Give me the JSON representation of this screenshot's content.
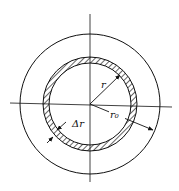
{
  "diagram": {
    "title": "",
    "labels": {
      "inner_radius": "r",
      "outer_radius": "r₀",
      "thickness": "Δr"
    },
    "elements": [
      {
        "type": "circle",
        "name": "outer-boundary",
        "r": 70
      },
      {
        "type": "annulus",
        "name": "hatched-shell",
        "r_inner": 41,
        "r_outer": 47,
        "fill": "hatched"
      },
      {
        "type": "axis",
        "name": "horizontal-centerline"
      },
      {
        "type": "axis",
        "name": "vertical-centerline"
      },
      {
        "type": "arrow",
        "name": "radius-r",
        "label": "r"
      },
      {
        "type": "arrow",
        "name": "radius-r0",
        "label": "r₀"
      },
      {
        "type": "dimension",
        "name": "thickness-dr",
        "label": "Δr"
      }
    ],
    "colors": {
      "stroke": "#111111",
      "background": "#ffffff"
    }
  }
}
